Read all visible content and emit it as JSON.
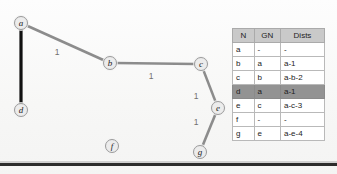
{
  "diagram": {
    "background_color": "#f9f9f8",
    "node_fill": "#ececec",
    "node_stroke": "#9a9a9a",
    "edge_color": "#8c8c8c",
    "edge_highlight_color": "#111111",
    "nodes": [
      {
        "id": "a",
        "label": "a",
        "x": 21,
        "y": 23
      },
      {
        "id": "b",
        "label": "b",
        "x": 110,
        "y": 63
      },
      {
        "id": "c",
        "label": "c",
        "x": 201,
        "y": 64
      },
      {
        "id": "d",
        "label": "d",
        "x": 21,
        "y": 110
      },
      {
        "id": "e",
        "label": "e",
        "x": 218,
        "y": 108
      },
      {
        "id": "f",
        "label": "f",
        "x": 112,
        "y": 146
      },
      {
        "id": "g",
        "label": "g",
        "x": 200,
        "y": 152
      }
    ],
    "edges": [
      {
        "from": "a",
        "to": "d",
        "label": "",
        "highlight": true
      },
      {
        "from": "a",
        "to": "b",
        "label": "1",
        "highlight": false,
        "label_x": 57,
        "label_y": 52
      },
      {
        "from": "b",
        "to": "c",
        "label": "1",
        "highlight": false,
        "label_x": 151,
        "label_y": 76
      },
      {
        "from": "c",
        "to": "e",
        "label": "1",
        "highlight": false,
        "label_x": 196,
        "label_y": 96
      },
      {
        "from": "e",
        "to": "g",
        "label": "1",
        "highlight": false,
        "label_x": 196,
        "label_y": 122
      }
    ]
  },
  "table": {
    "headers": [
      "N",
      "GN",
      "Dists"
    ],
    "header_bg": "#c9c9c9",
    "highlight_bg": "#939393",
    "rows": [
      {
        "n": "a",
        "gn": "-",
        "dists": "-",
        "highlight": false
      },
      {
        "n": "b",
        "gn": "a",
        "dists": "a-1",
        "highlight": false
      },
      {
        "n": "c",
        "gn": "b",
        "dists": "a-b-2",
        "highlight": false
      },
      {
        "n": "d",
        "gn": "a",
        "dists": "a-1",
        "highlight": true
      },
      {
        "n": "e",
        "gn": "c",
        "dists": "a-c-3",
        "highlight": false
      },
      {
        "n": "f",
        "gn": "-",
        "dists": "-",
        "highlight": false
      },
      {
        "n": "g",
        "gn": "e",
        "dists": "a-e-4",
        "highlight": false
      }
    ]
  }
}
